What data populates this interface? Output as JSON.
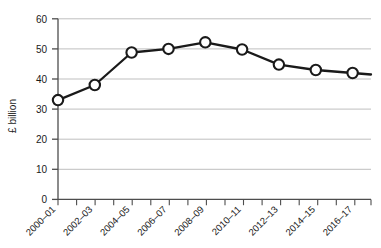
{
  "chart_data": {
    "type": "line",
    "title": "",
    "xlabel": "",
    "ylabel": "£ billion",
    "categories": [
      "2000–01",
      "2002–03",
      "2004–05",
      "2006–07",
      "2008–09",
      "2010–11",
      "2012–13",
      "2014–15",
      "2016–17"
    ],
    "values": [
      33,
      38,
      48.8,
      50,
      52.2,
      49.8,
      44.8,
      43,
      42
    ],
    "series": [
      {
        "name": "£ billion",
        "values": [
          33,
          38,
          48.8,
          50,
          52.2,
          49.8,
          44.8,
          43,
          42
        ]
      }
    ],
    "yticks": [
      0,
      10,
      20,
      30,
      40,
      50,
      60
    ],
    "ytick_labels": [
      "0",
      "10",
      "20",
      "30",
      "40",
      "50",
      "60"
    ],
    "ylim": [
      0,
      60
    ],
    "xlim": [
      0,
      17
    ],
    "grid": "horizontal",
    "legend": "none",
    "marker": "open-circle",
    "line_color": "#1a1a1a",
    "marker_fill": "#ffffff",
    "grid_color": "#bfbfbf",
    "axis_color": "#4d4d4d",
    "xtick_rotation": -45,
    "xtick_interval_years": 2,
    "minor_xticks_every_year": true
  },
  "axes": {
    "y_title": "£ billion",
    "y_labels": [
      "60",
      "50",
      "40",
      "30",
      "20",
      "10",
      "0"
    ],
    "x_labels": [
      "2000–01",
      "2002–03",
      "2004–05",
      "2006–07",
      "2008–09",
      "2010–11",
      "2012–13",
      "2014–15",
      "2016–17"
    ]
  }
}
